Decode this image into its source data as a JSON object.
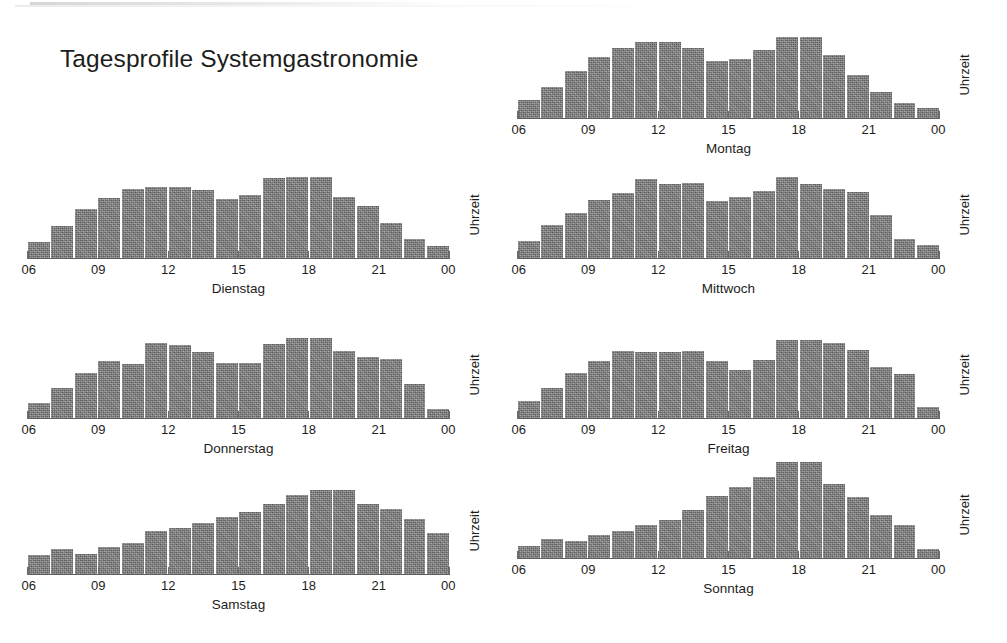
{
  "slide": {
    "title": "Tagesprofile Systemgastronomie"
  },
  "axis": {
    "y_caption": "Uhrzeit",
    "tick_labels": [
      "06",
      "09",
      "12",
      "15",
      "18",
      "21",
      "00"
    ]
  },
  "chart_data": [
    {
      "type": "bar",
      "title": "Montag",
      "xlabel": "",
      "ylabel": "Uhrzeit",
      "grid": false,
      "legend": "none",
      "xlim": [
        "06",
        "00"
      ],
      "ylim": [
        0,
        100
      ],
      "tick_labels": [
        "06",
        "09",
        "12",
        "15",
        "18",
        "21",
        "00"
      ],
      "categories": [
        "06",
        "07",
        "08",
        "09",
        "10",
        "11",
        "12",
        "13",
        "14",
        "15",
        "16",
        "17",
        "18",
        "19",
        "20",
        "21",
        "22",
        "23"
      ],
      "values": [
        17,
        29,
        44,
        57,
        66,
        71,
        71,
        66,
        53,
        55,
        64,
        76,
        76,
        59,
        40,
        24,
        14,
        9
      ]
    },
    {
      "type": "bar",
      "title": "Dienstag",
      "xlabel": "",
      "ylabel": "Uhrzeit",
      "grid": false,
      "legend": "none",
      "xlim": [
        "06",
        "00"
      ],
      "ylim": [
        0,
        100
      ],
      "tick_labels": [
        "06",
        "09",
        "12",
        "15",
        "18",
        "21",
        "00"
      ],
      "categories": [
        "06",
        "07",
        "08",
        "09",
        "10",
        "11",
        "12",
        "13",
        "14",
        "15",
        "16",
        "17",
        "18",
        "19",
        "20",
        "21",
        "22",
        "23"
      ],
      "values": [
        15,
        30,
        46,
        56,
        65,
        67,
        67,
        64,
        55,
        59,
        75,
        76,
        76,
        57,
        49,
        33,
        18,
        11
      ]
    },
    {
      "type": "bar",
      "title": "Mittwoch",
      "xlabel": "",
      "ylabel": "Uhrzeit",
      "grid": false,
      "legend": "none",
      "xlim": [
        "06",
        "00"
      ],
      "ylim": [
        0,
        100
      ],
      "tick_labels": [
        "06",
        "09",
        "12",
        "15",
        "18",
        "21",
        "00"
      ],
      "categories": [
        "06",
        "07",
        "08",
        "09",
        "10",
        "11",
        "12",
        "13",
        "14",
        "15",
        "16",
        "17",
        "18",
        "19",
        "20",
        "21",
        "22",
        "23"
      ],
      "values": [
        16,
        31,
        42,
        54,
        61,
        74,
        69,
        70,
        53,
        57,
        63,
        76,
        69,
        65,
        62,
        40,
        18,
        12
      ]
    },
    {
      "type": "bar",
      "title": "Donnerstag",
      "xlabel": "",
      "ylabel": "Uhrzeit",
      "grid": false,
      "legend": "none",
      "xlim": [
        "06",
        "00"
      ],
      "ylim": [
        0,
        100
      ],
      "tick_labels": [
        "06",
        "09",
        "12",
        "15",
        "18",
        "21",
        "00"
      ],
      "categories": [
        "06",
        "07",
        "08",
        "09",
        "10",
        "11",
        "12",
        "13",
        "14",
        "15",
        "16",
        "17",
        "18",
        "19",
        "20",
        "21",
        "22",
        "23"
      ],
      "values": [
        14,
        28,
        42,
        53,
        51,
        70,
        68,
        62,
        52,
        52,
        69,
        75,
        75,
        63,
        57,
        55,
        32,
        8
      ]
    },
    {
      "type": "bar",
      "title": "Freitag",
      "xlabel": "",
      "ylabel": "Uhrzeit",
      "grid": false,
      "legend": "none",
      "xlim": [
        "06",
        "00"
      ],
      "ylim": [
        0,
        100
      ],
      "tick_labels": [
        "06",
        "09",
        "12",
        "15",
        "18",
        "21",
        "00"
      ],
      "categories": [
        "06",
        "07",
        "08",
        "09",
        "10",
        "11",
        "12",
        "13",
        "14",
        "15",
        "16",
        "17",
        "18",
        "19",
        "20",
        "21",
        "22",
        "23"
      ],
      "values": [
        16,
        28,
        42,
        53,
        63,
        62,
        62,
        63,
        53,
        45,
        54,
        73,
        73,
        70,
        64,
        48,
        41,
        10
      ]
    },
    {
      "type": "bar",
      "title": "Samstag",
      "xlabel": "",
      "ylabel": "Uhrzeit",
      "grid": false,
      "legend": "none",
      "xlim": [
        "06",
        "00"
      ],
      "ylim": [
        0,
        100
      ],
      "tick_labels": [
        "06",
        "09",
        "12",
        "15",
        "18",
        "21",
        "00"
      ],
      "categories": [
        "06",
        "07",
        "08",
        "09",
        "10",
        "11",
        "12",
        "13",
        "14",
        "15",
        "16",
        "17",
        "18",
        "19",
        "20",
        "21",
        "22",
        "23"
      ],
      "values": [
        18,
        23,
        19,
        25,
        29,
        40,
        43,
        48,
        53,
        58,
        66,
        74,
        79,
        79,
        66,
        61,
        52,
        38
      ]
    },
    {
      "type": "bar",
      "title": "Sonntag",
      "xlabel": "",
      "ylabel": "Uhrzeit",
      "grid": false,
      "legend": "none",
      "xlim": [
        "06",
        "00"
      ],
      "ylim": [
        0,
        100
      ],
      "tick_labels": [
        "06",
        "09",
        "12",
        "15",
        "18",
        "21",
        "00"
      ],
      "categories": [
        "06",
        "07",
        "08",
        "09",
        "10",
        "11",
        "12",
        "13",
        "14",
        "15",
        "16",
        "17",
        "18",
        "19",
        "20",
        "21",
        "22",
        "23"
      ],
      "values": [
        11,
        18,
        16,
        22,
        25,
        31,
        36,
        45,
        58,
        67,
        76,
        90,
        90,
        69,
        57,
        40,
        31,
        8
      ]
    }
  ]
}
